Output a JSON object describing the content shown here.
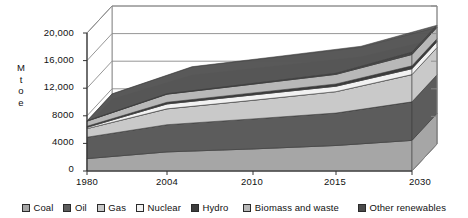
{
  "axis": {
    "y_title_chars": [
      "M",
      "t",
      "o",
      "e"
    ],
    "y_ticks": [
      "20,000",
      "16,000",
      "12,000",
      "8000",
      "4000",
      "0"
    ],
    "x_ticks": [
      "1980",
      "2004",
      "2010",
      "2015",
      "2030"
    ]
  },
  "legend": {
    "items": [
      {
        "label": "Coal",
        "color": "#a6a6a6"
      },
      {
        "label": "Oil",
        "color": "#5c5c5c"
      },
      {
        "label": "Gas",
        "color": "#c9c9c9"
      },
      {
        "label": "Nuclear",
        "color": "#f2f2f2"
      },
      {
        "label": "Hydro",
        "color": "#3d3d3d"
      },
      {
        "label": "Biomass and waste",
        "color": "#b8b8b8"
      },
      {
        "label": "Other renewables",
        "color": "#4a4a4a"
      }
    ]
  },
  "chart_data": {
    "type": "area",
    "title": "",
    "xlabel": "",
    "ylabel": "Mtoe",
    "x": [
      "1980",
      "2004",
      "2010",
      "2015",
      "2030"
    ],
    "xlim": [
      1980,
      2030
    ],
    "ylim": [
      0,
      20000
    ],
    "yticks": [
      0,
      4000,
      8000,
      12000,
      16000,
      20000
    ],
    "grid": true,
    "stacked": true,
    "three_d": true,
    "legend_position": "bottom",
    "series": [
      {
        "name": "Coal",
        "color": "#a6a6a6",
        "values": [
          1800,
          2770,
          3200,
          3700,
          4440
        ]
      },
      {
        "name": "Oil",
        "color": "#5c5c5c",
        "values": [
          3100,
          3940,
          4350,
          4700,
          5580
        ]
      },
      {
        "name": "Gas",
        "color": "#c9c9c9",
        "values": [
          1240,
          2300,
          2700,
          3100,
          3950
        ]
      },
      {
        "name": "Nuclear",
        "color": "#f2f2f2",
        "values": [
          190,
          710,
          780,
          790,
          860
        ]
      },
      {
        "name": "Hydro",
        "color": "#3d3d3d",
        "values": [
          150,
          240,
          280,
          320,
          410
        ]
      },
      {
        "name": "Biomass and waste",
        "color": "#b8b8b8",
        "values": [
          750,
          1180,
          1280,
          1400,
          1650
        ]
      },
      {
        "name": "Other renewables",
        "color": "#4a4a4a",
        "values": [
          30,
          60,
          100,
          150,
          320
        ]
      }
    ],
    "totals": [
      7260,
      11200,
      12690,
      14160,
      17210
    ]
  }
}
